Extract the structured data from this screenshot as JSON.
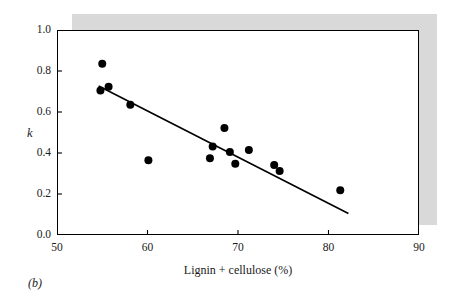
{
  "figure": {
    "panel_label": "(b)",
    "background_color": "#ffffff",
    "shadow_color": "#d9d9d9",
    "frame_color": "#000000",
    "marker_color": "#000000",
    "line_color": "#000000"
  },
  "chart_data": {
    "type": "scatter",
    "title": "",
    "subtitle": "",
    "xlabel": "Lignin + cellulose (%)",
    "ylabel": "k",
    "xlim": [
      50,
      90
    ],
    "ylim": [
      0.0,
      1.0
    ],
    "xticks": [
      50,
      60,
      70,
      80,
      90
    ],
    "xtick_labels": [
      "50",
      "60",
      "70",
      "80",
      "90"
    ],
    "yticks": [
      0.0,
      0.2,
      0.4,
      0.6,
      0.8,
      1.0
    ],
    "ytick_labels": [
      "0.0",
      "0.2",
      "0.4",
      "0.6",
      "0.8",
      "1.0"
    ],
    "grid": false,
    "legend": null,
    "legend_position": "none",
    "x": [
      55.0,
      54.8,
      55.7,
      58.1,
      60.1,
      66.9,
      67.2,
      68.5,
      69.1,
      69.7,
      71.2,
      74.0,
      74.6,
      81.3
    ],
    "y": [
      0.835,
      0.705,
      0.723,
      0.635,
      0.365,
      0.375,
      0.432,
      0.522,
      0.405,
      0.348,
      0.415,
      0.342,
      0.312,
      0.218
    ],
    "points": [
      {
        "x": 55.0,
        "y": 0.835
      },
      {
        "x": 54.8,
        "y": 0.705
      },
      {
        "x": 55.7,
        "y": 0.723
      },
      {
        "x": 58.1,
        "y": 0.635
      },
      {
        "x": 60.1,
        "y": 0.365
      },
      {
        "x": 66.9,
        "y": 0.375
      },
      {
        "x": 67.2,
        "y": 0.432
      },
      {
        "x": 68.5,
        "y": 0.522
      },
      {
        "x": 69.1,
        "y": 0.405
      },
      {
        "x": 69.7,
        "y": 0.348
      },
      {
        "x": 71.2,
        "y": 0.415
      },
      {
        "x": 74.0,
        "y": 0.342
      },
      {
        "x": 74.6,
        "y": 0.312
      },
      {
        "x": 81.3,
        "y": 0.218
      }
    ],
    "marker_size": 5.2,
    "trendline": {
      "type": "linear-fit",
      "x_start": 54.6,
      "y_start": 0.727,
      "x_end": 82.2,
      "y_end": 0.105,
      "width": 1.6
    }
  }
}
